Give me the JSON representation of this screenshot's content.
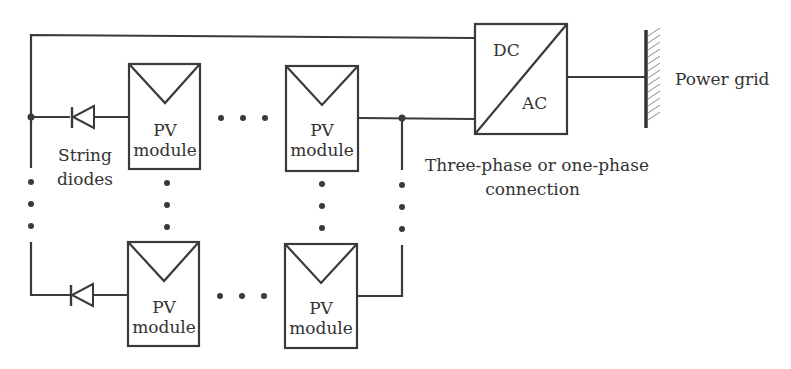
{
  "diagram": {
    "inverter": {
      "top_label": "DC",
      "bottom_label": "AC"
    },
    "grid_label": "Power grid",
    "connection_label_line1": "Three-phase or one-phase",
    "connection_label_line2": "connection",
    "diode_label_line1": "String",
    "diode_label_line2": "diodes",
    "modules": [
      {
        "line1": "PV",
        "line2": "module"
      },
      {
        "line1": "PV",
        "line2": "module"
      },
      {
        "line1": "PV",
        "line2": "module"
      },
      {
        "line1": "PV",
        "line2": "module"
      }
    ],
    "colors": {
      "line": "#3a3a3a",
      "background": "#ffffff"
    }
  }
}
